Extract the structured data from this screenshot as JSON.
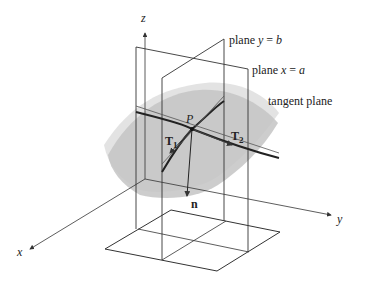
{
  "figure": {
    "axes": {
      "x": "x",
      "y": "y",
      "z": "z"
    },
    "labels": {
      "plane_y": {
        "prefix": "plane ",
        "var": "y",
        "eq": " = ",
        "val": "b"
      },
      "plane_x": {
        "prefix": "plane ",
        "var": "x",
        "eq": " = ",
        "val": "a"
      },
      "tangent_plane": "tangent plane",
      "point": "P",
      "t1": "T",
      "t1_sub": "1",
      "t2": "T",
      "t2_sub": "2",
      "normal": "n"
    },
    "colors": {
      "surface": "#c8c8c8",
      "tangent": "#e0e0e0",
      "line": "#333333"
    }
  }
}
